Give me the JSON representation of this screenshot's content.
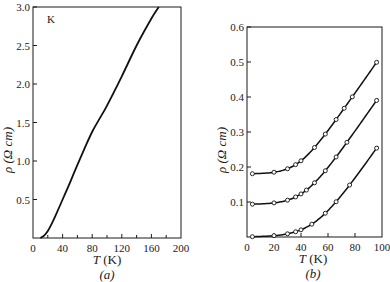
{
  "chart_data": [
    {
      "panel": "(a)",
      "type": "line",
      "annotation": "K",
      "xlabel": "T (K)",
      "ylabel": "ρ (Ω cm)",
      "xlim": [
        0,
        200
      ],
      "ylim": [
        0,
        3.0
      ],
      "xticks": [
        "0",
        "40",
        "80",
        "120",
        "160",
        "200"
      ],
      "yticks": [
        "0.5",
        "1.0",
        "1.5",
        "2.0",
        "2.5",
        "3.0"
      ],
      "series": [
        {
          "name": "K",
          "x": [
            10,
            15,
            20,
            25,
            30,
            40,
            50,
            60,
            70,
            80,
            90,
            100,
            120,
            140,
            160,
            170
          ],
          "y": [
            0.0,
            0.03,
            0.09,
            0.18,
            0.28,
            0.5,
            0.72,
            0.95,
            1.17,
            1.38,
            1.55,
            1.72,
            2.1,
            2.5,
            2.85,
            3.0
          ]
        }
      ]
    },
    {
      "panel": "(b)",
      "type": "line",
      "xlabel": "T (K)",
      "ylabel": "ρ (Ω cm)",
      "xlim": [
        0,
        100
      ],
      "ylim": [
        0,
        0.6
      ],
      "xticks": [
        "0",
        "20",
        "40",
        "60",
        "80",
        "100"
      ],
      "yticks": [
        "0.1",
        "0.2",
        "0.3",
        "0.4",
        "0.5",
        "0.6"
      ],
      "series": [
        {
          "name": "upper",
          "x": [
            4,
            20,
            30,
            36,
            40,
            50,
            58,
            66,
            72,
            78,
            96
          ],
          "y": [
            0.18,
            0.19,
            0.213,
            0.237,
            0.26,
            0.3,
            0.345,
            0.42,
            0.48,
            0.48,
            0.585
          ]
        },
        {
          "name": "middle",
          "x": [
            4,
            20,
            30,
            36,
            40,
            44,
            50,
            58,
            66,
            74,
            96
          ],
          "y": [
            0.093,
            0.1,
            0.117,
            0.14,
            0.16,
            0.19,
            0.23,
            0.31,
            0.385,
            0.47,
            0.47
          ]
        },
        {
          "name": "lower",
          "x": [
            4,
            20,
            30,
            36,
            40,
            48,
            58,
            66,
            76,
            96
          ],
          "y": [
            0.0,
            0.01,
            0.03,
            0.05,
            0.072,
            0.105,
            0.15,
            0.22,
            0.3,
            0.39
          ]
        }
      ]
    }
  ],
  "labels": {
    "a": {
      "annotation": "K",
      "xlabel_T": "T",
      "xlabel_unit": "(K)",
      "ylabel": "ρ (Ω cm)",
      "caption": "(a)"
    },
    "b": {
      "xlabel_T": "T",
      "xlabel_unit": "(K)",
      "ylabel": "ρ (Ω cm)",
      "caption": "(b)"
    }
  }
}
